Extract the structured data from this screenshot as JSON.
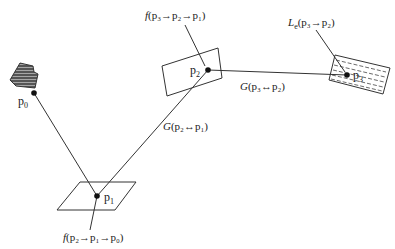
{
  "diagram": {
    "points": {
      "p0": {
        "label": "p",
        "sub": "0"
      },
      "p1": {
        "label": "p",
        "sub": "1"
      },
      "p2": {
        "label": "p",
        "sub": "2"
      },
      "p3": {
        "label": "p",
        "sub": "3"
      }
    },
    "labels": {
      "f_p3_p2_p1": {
        "fn": "f",
        "text": "(p₃→p₂→p₁)"
      },
      "le_p3_p2": {
        "fn": "L",
        "fn_sub": "e",
        "text": "(p₃→p₂)"
      },
      "g_p3_p2": {
        "fn": "G",
        "text": "(p₃↔p₂)"
      },
      "g_p2_p1": {
        "fn": "G",
        "text": "(p₂↔p₁)"
      },
      "f_p2_p1_p0": {
        "fn": "f",
        "text": "(p₂→p₁→p₀)"
      }
    },
    "colors": {
      "stroke": "#333333",
      "dot": "#111111",
      "camera_fill": "#444444"
    }
  }
}
